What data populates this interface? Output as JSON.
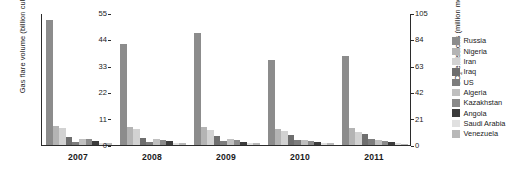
{
  "chart_data": {
    "type": "bar",
    "title": "",
    "xlabel": "",
    "ylabel": "Gas flare volume (billion cubic meters)",
    "ylabel_right": "CO2 emissions (million metric tons)",
    "categories": [
      "2007",
      "2008",
      "2009",
      "2010",
      "2011"
    ],
    "ylim": [
      0,
      55
    ],
    "yticks": [
      0,
      11,
      22,
      33,
      44,
      55
    ],
    "ylim_right": [
      0,
      105
    ],
    "yticks_right": [
      0,
      21,
      42,
      63,
      84,
      105
    ],
    "grid": false,
    "legend_position": "right",
    "series": [
      {
        "name": "Russia",
        "color": "#8c8c8c",
        "values": [
          52.0,
          42.0,
          46.5,
          35.5,
          37.0
        ]
      },
      {
        "name": "Nigeria",
        "color": "#b4b4b4",
        "values": [
          8.0,
          7.3,
          7.5,
          6.8,
          7.0
        ]
      },
      {
        "name": "Iran",
        "color": "#d2d2d2",
        "values": [
          6.9,
          6.5,
          6.3,
          5.8,
          5.6
        ]
      },
      {
        "name": "Iraq",
        "color": "#6e6e6e",
        "values": [
          3.2,
          3.0,
          3.8,
          4.2,
          4.5
        ]
      },
      {
        "name": "US",
        "color": "#7d7d7d",
        "values": [
          1.2,
          1.4,
          1.6,
          2.1,
          2.4
        ]
      },
      {
        "name": "Algeria",
        "color": "#c0c0c0",
        "values": [
          2.4,
          2.6,
          2.5,
          2.2,
          2.0
        ]
      },
      {
        "name": "Kazakhstan",
        "color": "#8a8a8a",
        "values": [
          2.3,
          2.2,
          2.0,
          1.6,
          1.5
        ]
      },
      {
        "name": "Angola",
        "color": "#3c3c3c",
        "values": [
          1.5,
          1.6,
          1.4,
          1.3,
          1.2
        ]
      },
      {
        "name": "Saudi Arabia",
        "color": "#e0e0e0",
        "values": [
          1.0,
          0.9,
          0.9,
          0.9,
          0.8
        ]
      },
      {
        "name": "Venezuela",
        "color": "#b8b8b8",
        "values": [
          0.7,
          0.7,
          0.8,
          0.7,
          0.6
        ]
      }
    ]
  },
  "axes": {
    "left_title": "Gas flare volume (billion cubic meters)",
    "right_title_main": "emissions (million metric tons)",
    "right_title_prefix": "CO",
    "right_title_sub": "2"
  }
}
